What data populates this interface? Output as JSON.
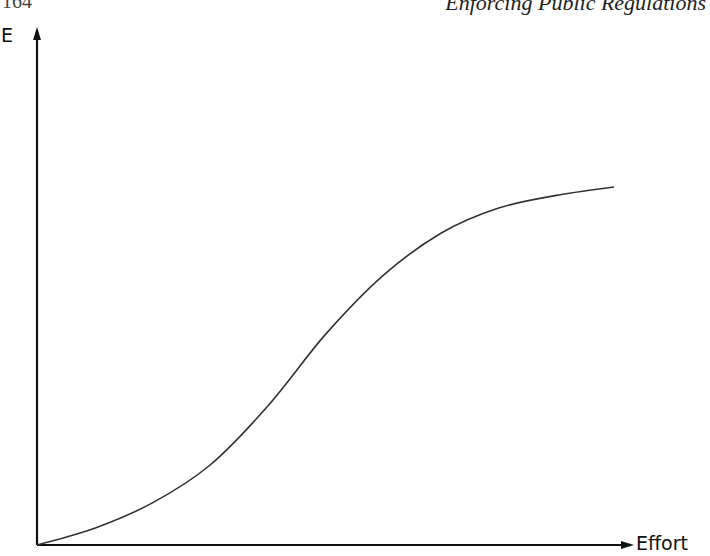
{
  "page": {
    "running_head": "Enforcing Public Regulations",
    "page_number": "164"
  },
  "chart_data": {
    "type": "line",
    "title": "",
    "xlabel": "Effort",
    "ylabel": "E",
    "x_ticks": [],
    "y_ticks": [],
    "grid": false,
    "legend": null,
    "shape": "S-shaped (logistic) curve: starts at origin, slow convex rise, inflection near mid-range, then concave flattening toward a plateau",
    "series": [
      {
        "name": "E vs Effort",
        "x": [
          0,
          0.1,
          0.2,
          0.3,
          0.4,
          0.5,
          0.6,
          0.7,
          0.8,
          0.9,
          1.0
        ],
        "values": [
          0,
          0.04,
          0.1,
          0.19,
          0.33,
          0.5,
          0.64,
          0.74,
          0.8,
          0.83,
          0.85
        ]
      }
    ],
    "xlim": [
      0,
      1.05
    ],
    "ylim": [
      0,
      1.0
    ]
  }
}
